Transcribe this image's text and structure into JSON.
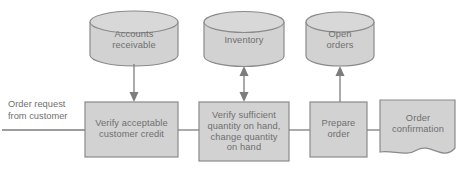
{
  "diagram": {
    "colors": {
      "shape_fill": "#d2d2d2",
      "shape_stroke": "#8a8a8a",
      "connector": "#7d7d7d",
      "text": "#6f6f6f",
      "background": "#ffffff"
    },
    "external_inputs": [
      {
        "id": "order-request",
        "label": "Order request\nfrom customer"
      }
    ],
    "data_stores": [
      {
        "id": "accounts-receivable",
        "label": "Accounts\nreceivable",
        "shape": "cylinder"
      },
      {
        "id": "inventory",
        "label": "Inventory",
        "shape": "cylinder"
      },
      {
        "id": "open-orders",
        "label": "Open\norders",
        "shape": "cylinder"
      }
    ],
    "processes": [
      {
        "id": "verify-credit",
        "label": "Verify acceptable\ncustomer credit",
        "shape": "rectangle"
      },
      {
        "id": "verify-quantity",
        "label": "Verify sufficient\nquantity on hand,\nchange quantity\non hand",
        "shape": "rectangle"
      },
      {
        "id": "prepare-order",
        "label": "Prepare\norder",
        "shape": "rectangle"
      }
    ],
    "outputs": [
      {
        "id": "order-confirmation",
        "label": "Order\nconfirmation",
        "shape": "document"
      }
    ],
    "flows": [
      {
        "id": "flow-input-to-credit",
        "from": "order-request",
        "to": "verify-credit",
        "direction": "one-way",
        "arrowhead": false
      },
      {
        "id": "flow-ar-to-credit",
        "from": "accounts-receivable",
        "to": "verify-credit",
        "direction": "one-way",
        "arrowhead": true
      },
      {
        "id": "flow-credit-to-quantity",
        "from": "verify-credit",
        "to": "verify-quantity",
        "direction": "one-way",
        "arrowhead": false
      },
      {
        "id": "flow-inventory-quantity",
        "from": "inventory",
        "to": "verify-quantity",
        "direction": "two-way",
        "arrowhead": true
      },
      {
        "id": "flow-quantity-to-prepare",
        "from": "verify-quantity",
        "to": "prepare-order",
        "direction": "one-way",
        "arrowhead": false
      },
      {
        "id": "flow-prepare-to-open-orders",
        "from": "prepare-order",
        "to": "open-orders",
        "direction": "one-way",
        "arrowhead": true
      },
      {
        "id": "flow-prepare-to-confirmation",
        "from": "prepare-order",
        "to": "order-confirmation",
        "direction": "one-way",
        "arrowhead": false
      }
    ]
  }
}
